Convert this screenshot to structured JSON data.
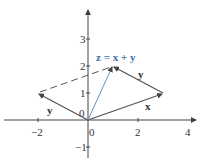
{
  "diagram": {
    "axes": {
      "x_ticks": [
        {
          "value": -2,
          "label": "−2"
        },
        {
          "value": 2,
          "label": "2"
        },
        {
          "value": 4,
          "label": "4"
        }
      ],
      "y_ticks": [
        {
          "value": -1,
          "label": "−1"
        },
        {
          "value": 1,
          "label": "1"
        },
        {
          "value": 2,
          "label": "2"
        },
        {
          "value": 3,
          "label": "3"
        }
      ],
      "origin_labels": {
        "x": "0",
        "y": "0"
      }
    },
    "vectors": [
      {
        "name": "x",
        "label": "x",
        "from": [
          0,
          0
        ],
        "to": [
          3,
          1
        ],
        "style": "solid",
        "color": "#555555"
      },
      {
        "name": "y",
        "label": "y",
        "from": [
          0,
          0
        ],
        "to": [
          -2,
          1
        ],
        "style": "solid",
        "color": "#555555"
      },
      {
        "name": "y-translated",
        "label": "y",
        "from": [
          3,
          1
        ],
        "to": [
          1,
          2
        ],
        "style": "solid",
        "color": "#555555"
      },
      {
        "name": "z",
        "label": "z = x + y",
        "from": [
          0,
          0
        ],
        "to": [
          1,
          2
        ],
        "style": "solid",
        "color": "#6a8fc8"
      },
      {
        "name": "dashed-guide",
        "label": "",
        "from": [
          -2,
          1
        ],
        "to": [
          1,
          2
        ],
        "style": "dashed",
        "color": "#555555"
      }
    ],
    "labels": {
      "sum": "z = x + y",
      "x": "x",
      "y_left": "y",
      "y_right": "y",
      "x_tick_neg2": "−2",
      "x_tick_0": "0",
      "x_tick_2": "2",
      "x_tick_4": "4",
      "y_tick_neg1": "−1",
      "y_tick_0": "0",
      "y_tick_1": "1",
      "y_tick_2": "2",
      "y_tick_3": "3"
    },
    "colors": {
      "axis": "#444444",
      "vector": "#555555",
      "sum_vector": "#6a8fc8",
      "sum_label": "#3b6fb0"
    }
  }
}
